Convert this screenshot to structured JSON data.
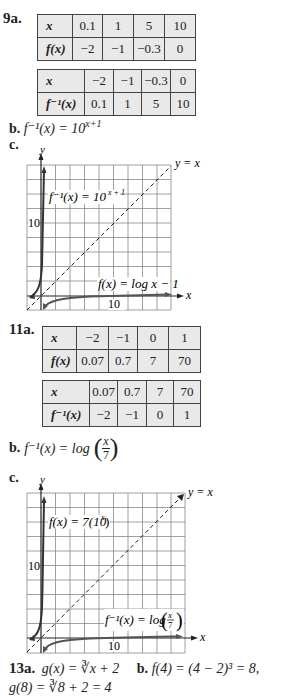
{
  "problem9": {
    "number": "9a.",
    "table1": {
      "row1_label": "x",
      "row1": [
        "0.1",
        "1",
        "5",
        "10"
      ],
      "row2_label": "f(x)",
      "row2": [
        "−2",
        "−1",
        "−0.3",
        "0"
      ]
    },
    "table2": {
      "row1_label": "x",
      "row1": [
        "−2",
        "−1",
        "−0.3",
        "0"
      ],
      "row2_label": "f⁻¹(x)",
      "row2": [
        "0.1",
        "1",
        "5",
        "10"
      ]
    },
    "part_b_label": "b.",
    "part_b_text": "f⁻¹(x) = 10",
    "part_b_exp": "x+1",
    "part_c_label": "c.",
    "graph": {
      "y_axis_label": "y",
      "x_axis_label": "x",
      "diag_label": "y = x",
      "y_tick_label": "10",
      "x_tick_label": "10",
      "curve1_label": "f⁻¹(x) = 10",
      "curve1_exp": "x + 1",
      "curve2_label": "f(x) = log x − 1"
    }
  },
  "problem11": {
    "number": "11a.",
    "table1": {
      "row1_label": "x",
      "row1": [
        "−2",
        "−1",
        "0",
        "1"
      ],
      "row2_label": "f(x)",
      "row2": [
        "0.07",
        "0.7",
        "7",
        "70"
      ]
    },
    "table2": {
      "row1_label": "x",
      "row1": [
        "0.07",
        "0.7",
        "7",
        "70"
      ],
      "row2_label": "f⁻¹(x)",
      "row2": [
        "−2",
        "−1",
        "0",
        "1"
      ]
    },
    "part_b_label": "b.",
    "part_b_text": "f⁻¹(x) = log",
    "part_b_frac_num": "x",
    "part_b_frac_den": "7",
    "part_c_label": "c.",
    "graph": {
      "y_axis_label": "y",
      "x_axis_label": "x",
      "diag_label": "y = x",
      "y_tick_label": "10",
      "x_tick_label": "10",
      "curve1_label": "f(x) = 7(10",
      "curve1_exp": "x",
      "curve1_close": ")",
      "curve2_label": "f⁻¹(x) = log",
      "curve2_frac_num": "x",
      "curve2_frac_den": "7"
    }
  },
  "problem13": {
    "number": "13a.",
    "part_a_text": "g(x) = ∛x + 2",
    "part_b_label": "b.",
    "part_b_text": "f(4) = (4 − 2)³ = 8,",
    "line2_text": "g(8) = ∛8 + 2 = 4"
  }
}
